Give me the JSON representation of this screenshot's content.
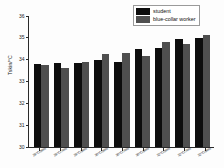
{
  "chart_data": {
    "type": "bar",
    "title": "",
    "xlabel": "",
    "ylabel": "Tskin/°C",
    "ylim": [
      30,
      36
    ],
    "yticks": [
      30,
      31,
      32,
      33,
      34,
      35,
      36
    ],
    "ytick_labels": [
      "30",
      "31",
      "32",
      "33",
      "34",
      "35",
      "36"
    ],
    "grid": false,
    "legend_position": "top-right",
    "categories": [
      "28°C/50%",
      "28°C/70%",
      "28°C/90%",
      "30°C/50%",
      "30°C/70%",
      "30°C/90%",
      "32°C/50%",
      "32°C/70%",
      "32°C/90%"
    ],
    "series": [
      {
        "name": "student",
        "color": "#0d0d0d",
        "values": [
          33.8,
          33.85,
          33.85,
          34.0,
          33.9,
          34.5,
          34.55,
          34.95,
          35.0
        ]
      },
      {
        "name": "blue-collar worker",
        "color": "#4f4f4f",
        "values": [
          33.75,
          33.6,
          33.9,
          34.28,
          34.32,
          34.18,
          34.8,
          34.7,
          35.15
        ]
      }
    ]
  }
}
